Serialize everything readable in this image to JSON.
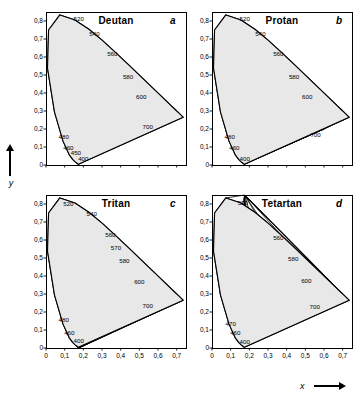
{
  "figure": {
    "xlabel": "x",
    "ylabel": "y"
  },
  "axis": {
    "yticks": [
      "0,8",
      "0,7",
      "0,6",
      "0,5",
      "0,4",
      "0,3",
      "0,2",
      "0,1",
      "0"
    ],
    "xticks": [
      "0",
      "0,1",
      "0,2",
      "0,3",
      "0,4",
      "0,5",
      "0,6",
      "0,7"
    ]
  },
  "panels": [
    {
      "title": "Deutan",
      "letter": "a"
    },
    {
      "title": "Protan",
      "letter": "b"
    },
    {
      "title": "Tritan",
      "letter": "c"
    },
    {
      "title": "Tetartan",
      "letter": "d"
    }
  ],
  "chart_data": {
    "type": "line",
    "xlabel": "x",
    "ylabel": "y",
    "xlim": [
      0,
      0.75
    ],
    "ylim": [
      0,
      0.85
    ],
    "grid": false,
    "legend": null,
    "panels": [
      {
        "name": "Deutan",
        "letter": "a",
        "copunctal_point": {
          "x": 0.5,
          "y": 0.25
        },
        "wavelength_labels": [
          {
            "label": "520",
            "x": 0.175,
            "y": 0.8
          },
          {
            "label": "540",
            "x": 0.26,
            "y": 0.715
          },
          {
            "label": "560",
            "x": 0.355,
            "y": 0.605
          },
          {
            "label": "580",
            "x": 0.44,
            "y": 0.48
          },
          {
            "label": "600",
            "x": 0.51,
            "y": 0.365
          },
          {
            "label": "700",
            "x": 0.545,
            "y": 0.2
          },
          {
            "label": "480",
            "x": 0.095,
            "y": 0.145
          },
          {
            "label": "460",
            "x": 0.12,
            "y": 0.085
          },
          {
            "label": "450",
            "x": 0.16,
            "y": 0.055
          },
          {
            "label": "400",
            "x": 0.2,
            "y": 0.025
          }
        ]
      },
      {
        "name": "Protan",
        "letter": "b",
        "copunctal_point": {
          "x": 0.6,
          "y": 0.2
        },
        "wavelength_labels": [
          {
            "label": "520",
            "x": 0.175,
            "y": 0.8
          },
          {
            "label": "540",
            "x": 0.26,
            "y": 0.715
          },
          {
            "label": "560",
            "x": 0.355,
            "y": 0.605
          },
          {
            "label": "580",
            "x": 0.44,
            "y": 0.48
          },
          {
            "label": "600",
            "x": 0.51,
            "y": 0.365
          },
          {
            "label": "700",
            "x": 0.555,
            "y": 0.155
          },
          {
            "label": "480",
            "x": 0.095,
            "y": 0.145
          },
          {
            "label": "460",
            "x": 0.12,
            "y": 0.085
          },
          {
            "label": "400",
            "x": 0.175,
            "y": 0.02
          }
        ]
      },
      {
        "name": "Tritan",
        "letter": "c",
        "copunctal_point": {
          "x": 0.175,
          "y": 0.0
        },
        "wavelength_labels": [
          {
            "label": "520",
            "x": 0.12,
            "y": 0.79
          },
          {
            "label": "540",
            "x": 0.245,
            "y": 0.735
          },
          {
            "label": "560",
            "x": 0.345,
            "y": 0.615
          },
          {
            "label": "570",
            "x": 0.375,
            "y": 0.545
          },
          {
            "label": "580",
            "x": 0.42,
            "y": 0.475
          },
          {
            "label": "600",
            "x": 0.5,
            "y": 0.355
          },
          {
            "label": "700",
            "x": 0.545,
            "y": 0.225
          },
          {
            "label": "480",
            "x": 0.095,
            "y": 0.145
          },
          {
            "label": "460",
            "x": 0.125,
            "y": 0.075
          },
          {
            "label": "400",
            "x": 0.175,
            "y": 0.03
          }
        ]
      },
      {
        "name": "Tetartan",
        "letter": "d",
        "copunctal_point": {
          "x": 0.175,
          "y": 0.85
        },
        "wavelength_labels": [
          {
            "label": "520",
            "x": 0.165,
            "y": 0.795
          },
          {
            "label": "560",
            "x": 0.355,
            "y": 0.6
          },
          {
            "label": "580",
            "x": 0.435,
            "y": 0.485
          },
          {
            "label": "600",
            "x": 0.505,
            "y": 0.36
          },
          {
            "label": "700",
            "x": 0.55,
            "y": 0.215
          },
          {
            "label": "470",
            "x": 0.1,
            "y": 0.12
          },
          {
            "label": "460",
            "x": 0.125,
            "y": 0.07
          },
          {
            "label": "400",
            "x": 0.175,
            "y": 0.025
          }
        ]
      }
    ]
  }
}
